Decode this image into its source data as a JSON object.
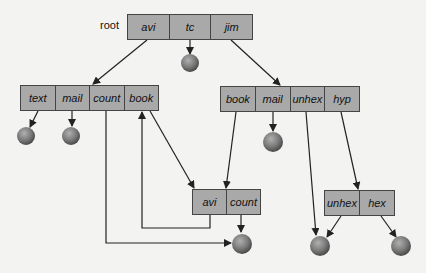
{
  "diagram": {
    "root_label": "root",
    "directories": [
      {
        "id": "root",
        "entries": [
          "avi",
          "tc",
          "jim"
        ]
      },
      {
        "id": "avi",
        "entries": [
          "text",
          "mail",
          "count",
          "book"
        ]
      },
      {
        "id": "jim",
        "entries": [
          "book",
          "mail",
          "unhex",
          "hyp"
        ]
      },
      {
        "id": "avi-book",
        "entries": [
          "avi",
          "count"
        ]
      },
      {
        "id": "jim-hyp",
        "entries": [
          "unhex",
          "hex"
        ]
      }
    ],
    "files": [
      "root/tc",
      "avi/text",
      "avi/mail",
      "jim/mail",
      "count (shared)",
      "unhex (shared)",
      "hyp/hex"
    ],
    "colors": {
      "box_fill": "#a9a9a9",
      "sphere": "#777777",
      "line": "#222222"
    }
  }
}
